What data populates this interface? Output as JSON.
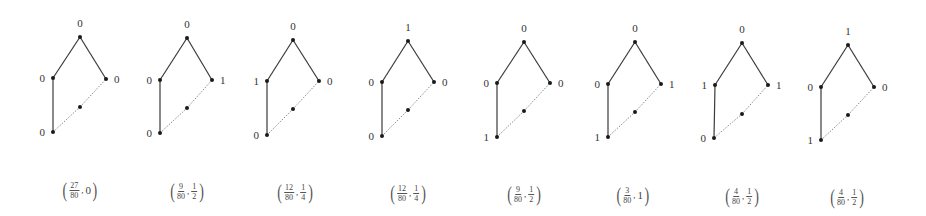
{
  "colors": {
    "solid_edge": "#3a3a3a",
    "dashed_edge": "#7a7a7a",
    "node": "#1a1a1a",
    "text": "#333333"
  },
  "graph_structure": {
    "nodes": [
      "top",
      "left",
      "right",
      "middle",
      "bottom"
    ],
    "solid_edges": [
      [
        "top",
        "left"
      ],
      [
        "top",
        "right"
      ],
      [
        "left",
        "bottom"
      ]
    ],
    "dashed_edges": [
      [
        "bottom",
        "middle"
      ],
      [
        "middle",
        "right"
      ]
    ]
  },
  "panels": [
    {
      "pos": {
        "top": [
          80,
          37
        ],
        "left": [
          53,
          78
        ],
        "right": [
          106,
          79
        ],
        "middle": [
          80,
          107
        ],
        "bottom": [
          53,
          132
        ]
      },
      "labels": {
        "top": "0",
        "left": "0",
        "right": "0",
        "bottom": "0"
      },
      "caption": {
        "x": 80,
        "y": 190,
        "first": {
          "num": "27",
          "den": "80"
        },
        "second": "0"
      }
    },
    {
      "pos": {
        "top": [
          187,
          38
        ],
        "left": [
          160,
          80
        ],
        "right": [
          212,
          80
        ],
        "middle": [
          187,
          108
        ],
        "bottom": [
          160,
          133
        ]
      },
      "labels": {
        "top": "0",
        "left": "0",
        "right": "1",
        "bottom": "0"
      },
      "caption": {
        "x": 187,
        "y": 191,
        "first": {
          "num": "9",
          "den": "80"
        },
        "second": {
          "num": "1",
          "den": "2"
        }
      }
    },
    {
      "pos": {
        "top": [
          293,
          40
        ],
        "left": [
          267,
          81
        ],
        "right": [
          319,
          81
        ],
        "middle": [
          293,
          109
        ],
        "bottom": [
          267,
          135
        ]
      },
      "labels": {
        "top": "0",
        "left": "1",
        "right": "0",
        "bottom": "0"
      },
      "caption": {
        "x": 295,
        "y": 192,
        "first": {
          "num": "12",
          "den": "80"
        },
        "second": {
          "num": "1",
          "den": "4"
        }
      }
    },
    {
      "pos": {
        "top": [
          408,
          41
        ],
        "left": [
          382,
          82
        ],
        "right": [
          434,
          82
        ],
        "middle": [
          408,
          110
        ],
        "bottom": [
          382,
          136
        ]
      },
      "labels": {
        "top": "1",
        "left": "0",
        "right": "0",
        "bottom": "0"
      },
      "caption": {
        "x": 408,
        "y": 193,
        "first": {
          "num": "12",
          "den": "80"
        },
        "second": {
          "num": "1",
          "den": "4"
        }
      }
    },
    {
      "pos": {
        "top": [
          524,
          42
        ],
        "left": [
          497,
          83
        ],
        "right": [
          550,
          83
        ],
        "middle": [
          524,
          111
        ],
        "bottom": [
          497,
          137
        ]
      },
      "labels": {
        "top": "0",
        "left": "0",
        "right": "0",
        "bottom": "1"
      },
      "caption": {
        "x": 524,
        "y": 194,
        "first": {
          "num": "9",
          "den": "80"
        },
        "second": {
          "num": "1",
          "den": "2"
        }
      }
    },
    {
      "pos": {
        "top": [
          635,
          42
        ],
        "left": [
          608,
          84
        ],
        "right": [
          661,
          84
        ],
        "middle": [
          635,
          112
        ],
        "bottom": [
          608,
          137
        ]
      },
      "labels": {
        "top": "0",
        "left": "0",
        "right": "1",
        "bottom": "1"
      },
      "caption": {
        "x": 633,
        "y": 195,
        "first": {
          "num": "3",
          "den": "80"
        },
        "second": "1"
      }
    },
    {
      "pos": {
        "top": [
          742,
          43
        ],
        "left": [
          715,
          85
        ],
        "right": [
          768,
          85
        ],
        "middle": [
          742,
          114
        ],
        "bottom": [
          714,
          138
        ]
      },
      "labels": {
        "top": "0",
        "left": "1",
        "right": "1",
        "bottom": "0"
      },
      "caption": {
        "x": 742,
        "y": 196,
        "first": {
          "num": "4",
          "den": "80"
        },
        "second": {
          "num": "1",
          "den": "2"
        }
      }
    },
    {
      "pos": {
        "top": [
          848,
          45
        ],
        "left": [
          821,
          87
        ],
        "right": [
          874,
          87
        ],
        "middle": [
          848,
          115
        ],
        "bottom": [
          821,
          140
        ]
      },
      "labels": {
        "top": "1",
        "left": "0",
        "right": "0",
        "bottom": "1"
      },
      "caption": {
        "x": 847,
        "y": 197,
        "first": {
          "num": "4",
          "den": "80"
        },
        "second": {
          "num": "1",
          "den": "2"
        }
      }
    }
  ]
}
